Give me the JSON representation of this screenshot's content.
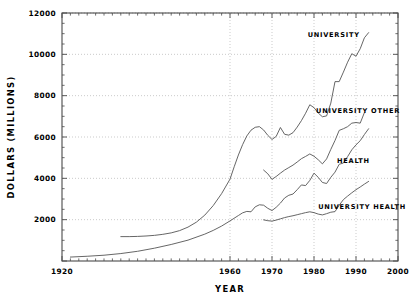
{
  "chart_data": {
    "type": "line",
    "title": "",
    "xlabel": "YEAR",
    "ylabel": "DOLLARS (MILLIONS)",
    "xlim": [
      1920,
      2000
    ],
    "ylim": [
      0,
      12000
    ],
    "grid": true,
    "legend_position": "inline-right-of-series",
    "x_ticks_major": [
      1920,
      1960,
      1970,
      1980,
      1990,
      2000
    ],
    "x_tick_labels": [
      "1920",
      "1960",
      "1970",
      "1980",
      "1990",
      "2000"
    ],
    "x_tick_minor_step": 2,
    "y_ticks_major": [
      0,
      2000,
      4000,
      6000,
      8000,
      10000,
      12000
    ],
    "y_tick_labels": [
      "",
      "2000",
      "4000",
      "6000",
      "8000",
      "10000",
      "12000"
    ],
    "y_tick_minor_step": 500,
    "series": [
      {
        "name": "UNIVERSITY",
        "label": "UNIVERSITY",
        "label_x": 1978.5,
        "label_y": 10950,
        "color": "#555555",
        "x": [
          1934,
          1936,
          1938,
          1940,
          1942,
          1944,
          1946,
          1948,
          1950,
          1952,
          1954,
          1956,
          1958,
          1960,
          1961,
          1962,
          1963,
          1964,
          1965,
          1966,
          1967,
          1968,
          1969,
          1970,
          1971,
          1972,
          1973,
          1974,
          1975,
          1976,
          1977,
          1978,
          1979,
          1980,
          1981,
          1982,
          1983,
          1984,
          1985,
          1986,
          1987,
          1988,
          1989,
          1990,
          1991,
          1992,
          1993
        ],
        "y": [
          1180,
          1180,
          1190,
          1210,
          1240,
          1290,
          1360,
          1470,
          1640,
          1880,
          2220,
          2680,
          3260,
          3960,
          4560,
          5130,
          5630,
          6050,
          6330,
          6470,
          6500,
          6340,
          6080,
          5880,
          6030,
          6460,
          6130,
          6090,
          6210,
          6480,
          6790,
          7150,
          7560,
          7420,
          7160,
          6980,
          7020,
          7640,
          8680,
          8680,
          9140,
          9620,
          10030,
          9910,
          10270,
          10800,
          11050
        ]
      },
      {
        "name": "HEALTH",
        "label": "HEALTH",
        "label_x": 1985.5,
        "label_y": 4860,
        "color": "#555555",
        "x": [
          1922,
          1926,
          1930,
          1934,
          1938,
          1942,
          1946,
          1950,
          1954,
          1956,
          1958,
          1960,
          1962,
          1963,
          1964,
          1965,
          1966,
          1967,
          1968,
          1969,
          1970,
          1971,
          1972,
          1973,
          1974,
          1975,
          1976,
          1977,
          1978,
          1979,
          1980,
          1981,
          1982,
          1983,
          1984,
          1985,
          1986,
          1987,
          1988,
          1989,
          1990,
          1991,
          1992,
          1993
        ],
        "y": [
          190,
          230,
          280,
          360,
          470,
          620,
          800,
          1010,
          1300,
          1480,
          1690,
          1940,
          2200,
          2330,
          2400,
          2380,
          2620,
          2720,
          2700,
          2550,
          2440,
          2600,
          2800,
          3050,
          3180,
          3240,
          3450,
          3680,
          3650,
          3900,
          4250,
          4050,
          3800,
          3750,
          4050,
          4300,
          4680,
          4740,
          5050,
          5380,
          5620,
          5820,
          6120,
          6400
        ]
      },
      {
        "name": "UNIVERSITY OTHER",
        "label": "UNIVERSITY OTHER",
        "label_x": 1980.5,
        "label_y": 7280,
        "color": "#555555",
        "x": [
          1968,
          1969,
          1970,
          1971,
          1972,
          1973,
          1974,
          1975,
          1976,
          1977,
          1978,
          1979,
          1980,
          1981,
          1982,
          1983,
          1984,
          1985,
          1986,
          1987,
          1988,
          1989,
          1990,
          1991,
          1992
        ],
        "y": [
          4400,
          4220,
          3950,
          4090,
          4250,
          4400,
          4520,
          4640,
          4790,
          4950,
          5060,
          5180,
          5070,
          4900,
          4700,
          4940,
          5400,
          5830,
          6320,
          6400,
          6500,
          6670,
          6700,
          6670,
          7180
        ]
      },
      {
        "name": "UNIVERSITY HEALTH",
        "label": "UNIVERSITY HEALTH",
        "label_x": 1981.0,
        "label_y": 2620,
        "color": "#555555",
        "x": [
          1968,
          1969,
          1970,
          1971,
          1972,
          1973,
          1974,
          1975,
          1976,
          1977,
          1978,
          1979,
          1980,
          1981,
          1982,
          1983,
          1984,
          1985,
          1986,
          1987,
          1988,
          1989,
          1990,
          1991,
          1992,
          1993
        ],
        "y": [
          1990,
          1950,
          1930,
          1980,
          2040,
          2100,
          2150,
          2190,
          2240,
          2290,
          2340,
          2380,
          2340,
          2270,
          2230,
          2290,
          2360,
          2390,
          2700,
          2970,
          3140,
          3300,
          3450,
          3580,
          3720,
          3850
        ]
      }
    ]
  }
}
